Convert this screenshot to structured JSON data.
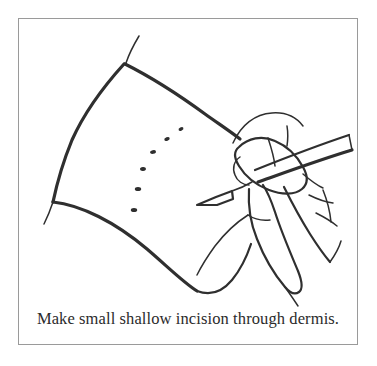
{
  "figure": {
    "caption": "Make small shallow incision through dermis.",
    "frame": {
      "border_color": "#9a9a9a",
      "background_color": "#ffffff",
      "border_width_px": 1.5
    },
    "ink_color": "#2f2f2f",
    "illustration": {
      "title": "Hand holding scalpel making shallow incision through dermis",
      "elements": [
        {
          "name": "skin-flap",
          "label": "Skin / dermis surface flap",
          "description": "Large quadrilateral sheet of skin drawn with curved edges occupying the left two-thirds of the frame"
        },
        {
          "name": "incision-guide-dots",
          "label": "Dotted incision guide line",
          "description": "Six short dashes forming a gentle arc marking the planned incision path",
          "dot_count": 6
        },
        {
          "name": "scalpel",
          "label": "Scalpel",
          "description": "Blade tip touching the skin at left, long straight handle extending to the upper right out of frame"
        },
        {
          "name": "hand",
          "label": "Surgeon's hand",
          "description": "Thumb and index finger gripping the scalpel, knuckle creases shown on the back of the hand"
        }
      ]
    }
  }
}
